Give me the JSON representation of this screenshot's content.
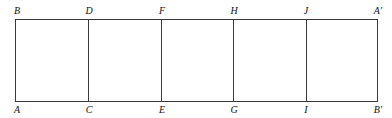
{
  "diagram": {
    "colors": {
      "line": "#3a3a3a",
      "label": "#111111",
      "background": "#ffffff"
    },
    "top_labels": [
      {
        "text": "B",
        "x": 16
      },
      {
        "text": "D",
        "x": 88
      },
      {
        "text": "F",
        "x": 161
      },
      {
        "text": "H",
        "x": 234
      },
      {
        "text": "J",
        "x": 306
      },
      {
        "text": "A′",
        "x": 378
      }
    ],
    "bottom_labels": [
      {
        "text": "A",
        "x": 16
      },
      {
        "text": "C",
        "x": 88
      },
      {
        "text": "E",
        "x": 161
      },
      {
        "text": "G",
        "x": 234
      },
      {
        "text": "I",
        "x": 306
      },
      {
        "text": "B′",
        "x": 378
      }
    ],
    "dividers_x": [
      88,
      161,
      233,
      306
    ],
    "segments": [
      "CD",
      "EF",
      "GH",
      "IJ"
    ]
  }
}
